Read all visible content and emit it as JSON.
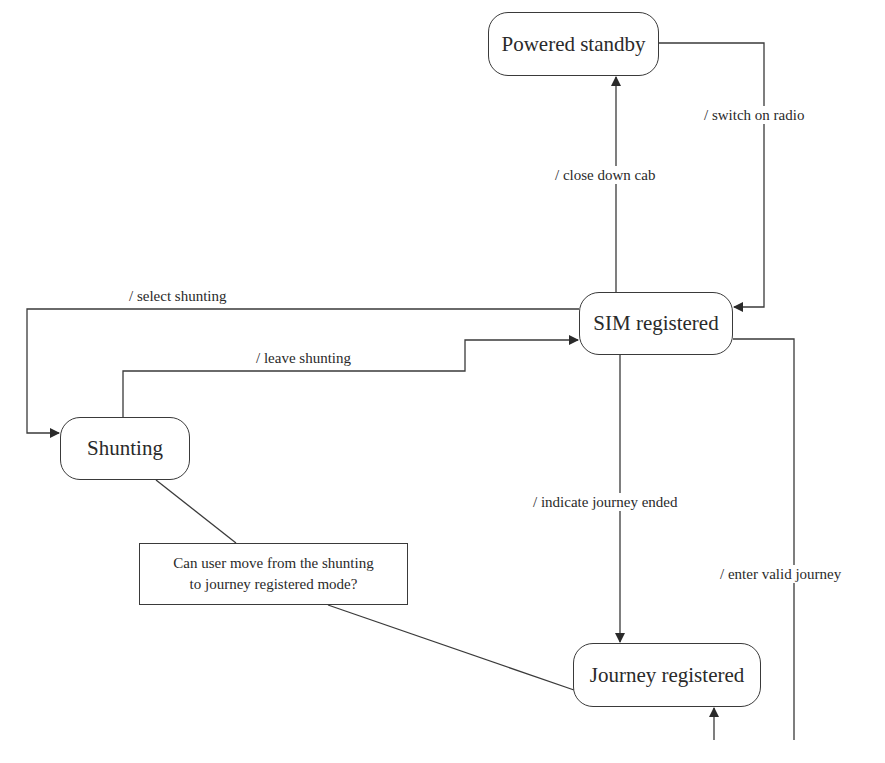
{
  "diagram": {
    "type": "state-machine",
    "states": [
      {
        "id": "powered_standby",
        "label": "Powered standby"
      },
      {
        "id": "sim_registered",
        "label": "SIM registered"
      },
      {
        "id": "shunting",
        "label": "Shunting"
      },
      {
        "id": "journey_registered",
        "label": "Journey registered"
      }
    ],
    "transitions": [
      {
        "from": "sim_registered",
        "to": "powered_standby",
        "label": "/ close down cab"
      },
      {
        "from": "powered_standby",
        "to": "sim_registered",
        "label": "/ switch on radio"
      },
      {
        "from": "sim_registered",
        "to": "shunting",
        "label": "/ select shunting"
      },
      {
        "from": "shunting",
        "to": "sim_registered",
        "label": "/ leave shunting"
      },
      {
        "from": "sim_registered",
        "to": "journey_registered",
        "label": "/ indicate journey ended"
      },
      {
        "from": "sim_registered",
        "to": "journey_registered",
        "label": "/ enter valid journey"
      }
    ],
    "note": {
      "line1": "Can user move from the shunting",
      "line2": "to journey registered mode?",
      "attached_to": [
        "shunting",
        "journey_registered"
      ]
    }
  },
  "colors": {
    "line": "#3a3a3a",
    "text": "#2a2a2a",
    "background": "#ffffff"
  }
}
